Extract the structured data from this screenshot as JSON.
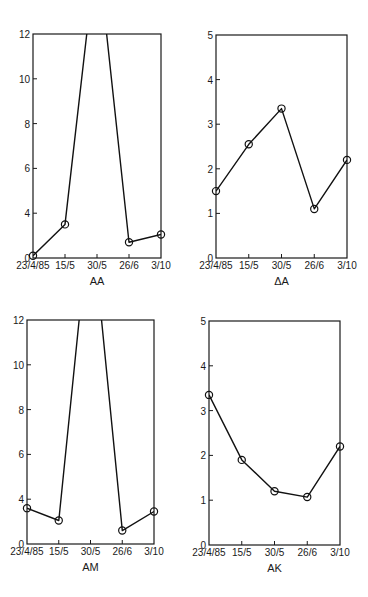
{
  "chart_data": [
    {
      "type": "line",
      "panel_label": "AA",
      "categories": [
        "23/4/85",
        "15/5",
        "30/5",
        "26/6",
        "3/10"
      ],
      "values": [
        0.2,
        3.0,
        16,
        1.4,
        2.1
      ],
      "clipped_points": [
        2
      ],
      "yticks": [
        0,
        4,
        6,
        8,
        10,
        12
      ],
      "ylim": [
        0,
        12
      ],
      "axis_break_note": "y-axis jumps from 0 to 4 in one tick interval",
      "xlabel": "AA",
      "ylabel": "",
      "grid": false,
      "markers": "open-circle",
      "frame": {
        "left": 33,
        "right": 161,
        "top": 34,
        "bottom": 258
      }
    },
    {
      "type": "line",
      "panel_label": "ΔA",
      "categories": [
        "23/4/85",
        "15/5",
        "30/5",
        "26/6",
        "3/10"
      ],
      "values": [
        1.5,
        2.55,
        3.35,
        1.1,
        2.2
      ],
      "clipped_points": [],
      "yticks": [
        0,
        1,
        2,
        3,
        4,
        5
      ],
      "ylim": [
        0,
        5
      ],
      "xlabel": "ΔA",
      "ylabel": "",
      "grid": false,
      "markers": "open-circle",
      "frame": {
        "left": 216,
        "right": 347,
        "top": 35,
        "bottom": 258
      }
    },
    {
      "type": "line",
      "panel_label": "AM",
      "categories": [
        "23/4/85",
        "15/5",
        "30/5",
        "26/6",
        "3/10"
      ],
      "values": [
        3.2,
        2.1,
        17,
        1.2,
        2.9
      ],
      "clipped_points": [
        2
      ],
      "yticks": [
        0,
        4,
        6,
        8,
        10,
        12
      ],
      "ylim": [
        0,
        12
      ],
      "axis_break_note": "y-axis jumps from 0 to 4 in one tick interval",
      "xlabel": "AM",
      "ylabel": "",
      "grid": false,
      "markers": "open-circle",
      "frame": {
        "left": 27,
        "right": 154,
        "top": 320,
        "bottom": 544
      }
    },
    {
      "type": "line",
      "panel_label": "AK",
      "categories": [
        "23/4/85",
        "15/5",
        "30/5",
        "26/6",
        "3/10"
      ],
      "values": [
        3.35,
        1.9,
        1.2,
        1.07,
        2.2
      ],
      "clipped_points": [],
      "yticks": [
        0,
        1,
        2,
        3,
        4,
        5
      ],
      "ylim": [
        0,
        5
      ],
      "xlabel": "AK",
      "ylabel": "",
      "grid": false,
      "markers": "open-circle",
      "frame": {
        "left": 209,
        "right": 340,
        "top": 321,
        "bottom": 545
      }
    }
  ]
}
